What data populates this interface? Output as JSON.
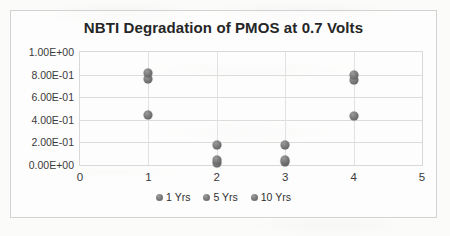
{
  "chart_data": {
    "type": "scatter",
    "title": "NBTI Degradation of PMOS at 0.7 Volts",
    "xlabel": "",
    "ylabel": "",
    "xlim": [
      0,
      5
    ],
    "ylim": [
      0.0,
      1.0
    ],
    "x_ticks": [
      "0",
      "1",
      "2",
      "3",
      "4",
      "5"
    ],
    "x_tick_values": [
      0,
      1,
      2,
      3,
      4,
      5
    ],
    "y_ticks": [
      "0.00E+00",
      "2.00E-01",
      "4.00E-01",
      "6.00E-01",
      "8.00E-01",
      "1.00E+00"
    ],
    "y_tick_values": [
      0.0,
      0.2,
      0.4,
      0.6,
      0.8,
      1.0
    ],
    "grid": true,
    "legend_position": "bottom",
    "x": [
      1,
      2,
      3,
      4
    ],
    "series": [
      {
        "name": "1 Yrs",
        "values": [
          0.44,
          0.02,
          0.03,
          0.43
        ]
      },
      {
        "name": "5 Yrs",
        "values": [
          0.76,
          0.04,
          0.04,
          0.75
        ]
      },
      {
        "name": "10 Yrs",
        "values": [
          0.81,
          0.18,
          0.18,
          0.8
        ]
      }
    ]
  }
}
